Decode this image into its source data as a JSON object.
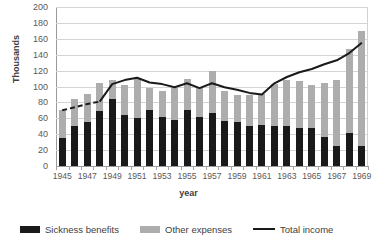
{
  "chart_data": {
    "type": "bar",
    "title": "",
    "xlabel": "year",
    "ylabel": "Thousands",
    "ylim": [
      0,
      200
    ],
    "ytick_step": 20,
    "yticks": [
      "0",
      "20",
      "40",
      "60",
      "80",
      "100",
      "120",
      "140",
      "160",
      "180",
      "200"
    ],
    "grid": true,
    "legend_position": "bottom",
    "stacked": true,
    "categories": [
      "1945",
      "1946",
      "1947",
      "1948",
      "1949",
      "1950",
      "1951",
      "1952",
      "1953",
      "1954",
      "1955",
      "1956",
      "1957",
      "1958",
      "1959",
      "1960",
      "1961",
      "1962",
      "1963",
      "1964",
      "1965",
      "1966",
      "1967",
      "1968",
      "1969"
    ],
    "tick_labels": [
      "1945",
      "1947",
      "1949",
      "1951",
      "1953",
      "1955",
      "1957",
      "1959",
      "1961",
      "1963",
      "1965",
      "1967",
      "1969"
    ],
    "series": [
      {
        "name": "Sickness benefits",
        "color": "#1a1a1a",
        "type": "bar",
        "values": [
          35,
          51,
          56,
          69,
          84,
          64,
          61,
          71,
          62,
          58,
          70,
          62,
          67,
          57,
          56,
          51,
          52,
          50,
          51,
          48,
          48,
          36,
          25,
          42,
          25
        ]
      },
      {
        "name": "Other expenses",
        "color": "#adadad",
        "type": "bar",
        "values": [
          35,
          34,
          35,
          35,
          24,
          38,
          50,
          27,
          32,
          40,
          40,
          38,
          52,
          37,
          34,
          38,
          39,
          53,
          57,
          59,
          54,
          69,
          83,
          105,
          145
        ]
      },
      {
        "name": "Total income",
        "color": "#1a1a1a",
        "type": "line",
        "dashed_range": [
          0,
          3
        ],
        "values": [
          70,
          74,
          78,
          81,
          103,
          108,
          111,
          105,
          103,
          99,
          104,
          98,
          104,
          99,
          96,
          92,
          90,
          104,
          112,
          118,
          122,
          128,
          133,
          142,
          155
        ]
      }
    ],
    "legend": [
      {
        "label": "Sickness benefits",
        "marker": "black-box"
      },
      {
        "label": "Other expenses",
        "marker": "gray-box"
      },
      {
        "label": "Total income",
        "marker": "black-line"
      }
    ]
  }
}
